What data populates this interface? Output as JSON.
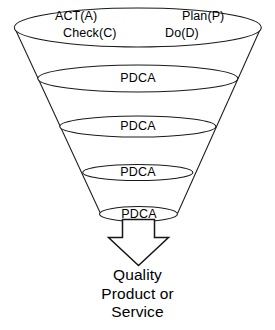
{
  "diagram": {
    "type": "funnel",
    "top_labels": {
      "act": "ACT(A)",
      "check": "Check(C)",
      "plan": "Plan(P)",
      "do": "Do(D)"
    },
    "stage_label": "PDCA",
    "stages": [
      {
        "label": "PDCA",
        "index": 1
      },
      {
        "label": "PDCA",
        "index": 2
      },
      {
        "label": "PDCA",
        "index": 3
      },
      {
        "label": "PDCA",
        "index": 4
      }
    ],
    "outcome": {
      "line1": "Quality",
      "line2": "Product or",
      "line3": "Service"
    },
    "colors": {
      "stroke": "#1a1a1a",
      "fill": "#ffffff",
      "text": "#000000",
      "background": "#ffffff"
    }
  }
}
